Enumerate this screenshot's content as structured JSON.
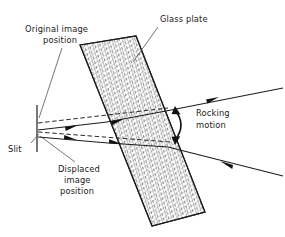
{
  "figure": {
    "background_color": "#ffffff",
    "ink_color": "#1d1d1d",
    "labels": {
      "glass_plate": "Glass plate",
      "original_image_line1": "Original  image",
      "original_image_line2": "position",
      "rocking_line1": "Rocking",
      "rocking_line2": "motion",
      "slit": "Slit",
      "displaced_line1": "Displaced",
      "displaced_line2": "image",
      "displaced_line3": "position"
    },
    "components": {
      "plate": {
        "name": "glass-plate",
        "fill_pattern": "cross-hatch",
        "corners": "80,45 136,36 205,212 152,226"
      },
      "slit": {
        "name": "slit",
        "x": 37,
        "y_top": 105,
        "y_bottom": 152
      },
      "rays": [
        {
          "name": "upper-incident-ray",
          "style": "solid",
          "direction": "right-to-left"
        },
        {
          "name": "lower-incident-ray",
          "style": "solid",
          "direction": "right-to-left"
        },
        {
          "name": "upper-virtual-ray",
          "style": "dashed"
        },
        {
          "name": "lower-virtual-ray",
          "style": "dashed"
        }
      ],
      "rocking_arrow": {
        "name": "rocking-motion-arrow",
        "type": "double-headed-arc"
      }
    }
  }
}
